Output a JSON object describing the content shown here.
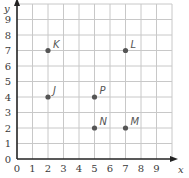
{
  "chart_data": {
    "type": "scatter",
    "title": "",
    "xlabel": "x",
    "ylabel": "y",
    "xlim": [
      0,
      10
    ],
    "ylim": [
      0,
      10
    ],
    "grid": true,
    "x_ticks": [
      "0",
      "1",
      "2",
      "3",
      "4",
      "5",
      "6",
      "7",
      "8",
      "9"
    ],
    "y_ticks": [
      "0",
      "1",
      "2",
      "3",
      "4",
      "5",
      "6",
      "7",
      "8",
      "9"
    ],
    "points": [
      {
        "label": "K",
        "x": 2,
        "y": 7
      },
      {
        "label": "L",
        "x": 7,
        "y": 7
      },
      {
        "label": "J",
        "x": 2,
        "y": 4
      },
      {
        "label": "P",
        "x": 5,
        "y": 4
      },
      {
        "label": "N",
        "x": 5,
        "y": 2
      },
      {
        "label": "M",
        "x": 7,
        "y": 2
      }
    ],
    "colors": {
      "grid": "#c8c8c8",
      "axis": "#222222",
      "point": "#555555"
    }
  }
}
